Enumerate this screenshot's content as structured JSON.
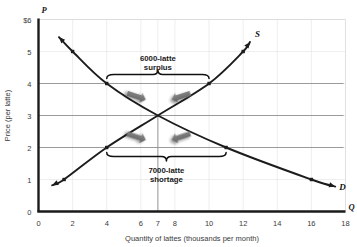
{
  "figure": {
    "background_color": "#ffffff",
    "curve_color": "#1c1c1c",
    "grid_color": "#8a8a8a",
    "faint_grid_color": "#e6e6e6",
    "arrow_color": "#6f6f6f",
    "text_color": "#3a3a3a"
  },
  "chart_data": {
    "type": "line",
    "title": "",
    "xlabel": "Quantity of lattes (thousands per month)",
    "ylabel": "Price (per latte)",
    "xlim": [
      0,
      18
    ],
    "ylim": [
      0,
      6
    ],
    "xticks": [
      0,
      2,
      4,
      6,
      7,
      8,
      10,
      12,
      14,
      16,
      18
    ],
    "xtick_labels": [
      "0",
      "2",
      "4",
      "6",
      "7",
      "8",
      "10",
      "12",
      "14",
      "16",
      "18"
    ],
    "yticks": [
      0,
      1,
      2,
      3,
      4,
      5,
      6
    ],
    "ytick_labels": [
      "0",
      "1",
      "2",
      "3",
      "4",
      "5",
      "6"
    ],
    "ytick_top_label": "$6",
    "x_axis_letter": "Q",
    "y_axis_letter": "P",
    "grid": true,
    "gridlines_horizontal": [
      2,
      3,
      4
    ],
    "gridline_vertical": 7,
    "equilibrium": {
      "quantity": 7,
      "price": 3
    },
    "series": [
      {
        "name": "Demand",
        "label": "D",
        "type": "line",
        "x": [
          1.2,
          2,
          4,
          7,
          11,
          16,
          17.4
        ],
        "y": [
          5.45,
          5.0,
          4.0,
          3.0,
          2.0,
          1.0,
          0.78
        ],
        "markers": [
          {
            "x": 2,
            "y": 5
          },
          {
            "x": 4,
            "y": 4
          },
          {
            "x": 11,
            "y": 2
          },
          {
            "x": 16,
            "y": 1
          }
        ]
      },
      {
        "name": "Supply",
        "label": "S",
        "type": "line",
        "x": [
          0.8,
          1.5,
          4,
          7,
          10,
          12,
          12.4
        ],
        "y": [
          0.82,
          1.0,
          2.0,
          3.0,
          4.0,
          5.0,
          5.3
        ],
        "markers": [
          {
            "x": 1.5,
            "y": 1
          },
          {
            "x": 4,
            "y": 2
          },
          {
            "x": 10,
            "y": 4
          },
          {
            "x": 12,
            "y": 5
          }
        ]
      }
    ],
    "annotations": [
      {
        "id": "surplus",
        "line1": "6000-latte",
        "line2": "surplus",
        "bracket_from_x": 4,
        "bracket_to_x": 10,
        "bracket_y": 4,
        "position": "above"
      },
      {
        "id": "shortage",
        "line1": "7000-latte",
        "line2": "shortage",
        "bracket_from_x": 4,
        "bracket_to_x": 11,
        "bracket_y": 2,
        "position": "below"
      }
    ],
    "pressure_arrows": [
      {
        "id": "surplus-left-arrow",
        "direction": "right",
        "x": 5.6,
        "y": 3.62
      },
      {
        "id": "surplus-right-arrow",
        "direction": "left",
        "x": 8.5,
        "y": 3.62
      },
      {
        "id": "shortage-left-arrow",
        "direction": "right",
        "x": 5.6,
        "y": 2.36
      },
      {
        "id": "shortage-right-arrow",
        "direction": "left",
        "x": 8.5,
        "y": 2.36
      }
    ]
  }
}
